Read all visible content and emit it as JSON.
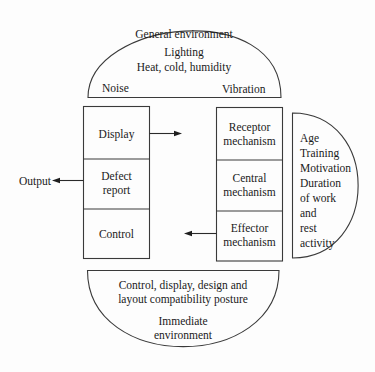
{
  "diagram": {
    "type": "human-machine system model",
    "general_environment": {
      "title": "General environment",
      "lines": [
        "Lighting",
        "Heat, cold, humidity"
      ],
      "left_label": "Noise",
      "right_label": "Vibration"
    },
    "machine": {
      "cells": [
        {
          "lines": [
            "Display"
          ]
        },
        {
          "lines": [
            "Defect",
            "report"
          ]
        },
        {
          "lines": [
            "Control"
          ]
        }
      ]
    },
    "human": {
      "cells": [
        {
          "lines": [
            "Receptor",
            "mechanism"
          ]
        },
        {
          "lines": [
            "Central",
            "mechanism"
          ]
        },
        {
          "lines": [
            "Effector",
            "mechanism"
          ]
        }
      ]
    },
    "personal_factors": {
      "lines": [
        "Age",
        "Training",
        "Motivation",
        "Duration",
        "of work",
        "and",
        "rest",
        "activity"
      ]
    },
    "immediate_environment": {
      "lines": [
        "Control, display, design and",
        "layout compatibility posture"
      ],
      "title_lines": [
        "Immediate",
        "environment"
      ]
    },
    "output_label": "Output",
    "arrows": [
      {
        "from": "Display",
        "to": "Receptor mechanism",
        "direction": "right"
      },
      {
        "from": "Effector mechanism",
        "to": "Control",
        "direction": "left"
      },
      {
        "from": "Defect report",
        "to": "Output",
        "direction": "left"
      }
    ]
  }
}
